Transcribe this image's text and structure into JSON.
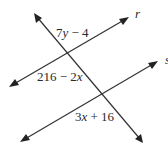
{
  "diagram": {
    "type": "parallel-lines-transversal",
    "colors": {
      "line": "#333333",
      "text": "#2a2a2a",
      "background": "#ffffff"
    },
    "lines": [
      {
        "id": "r",
        "label": "r",
        "from": [
          9,
          87
        ],
        "to": [
          129,
          17
        ],
        "arrows": "both"
      },
      {
        "id": "s",
        "label": "s",
        "from": [
          20,
          142
        ],
        "to": [
          158,
          61
        ],
        "arrows": "both"
      },
      {
        "id": "transversal",
        "label": "",
        "from": [
          34,
          13
        ],
        "to": [
          143,
          143
        ],
        "arrows": "both"
      }
    ],
    "line_labels": {
      "r": "r",
      "s": "s"
    },
    "angle_labels": {
      "top": "7y − 4",
      "middle": "216 − 2x",
      "bottom": "3x + 16"
    }
  }
}
